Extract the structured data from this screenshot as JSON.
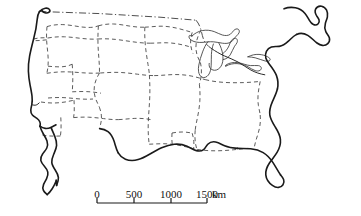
{
  "figure": {
    "kind": "outline-map",
    "region_label": "Contiguous United States",
    "background_color": "#ffffff",
    "coastline_color": "#1a1a1a",
    "state_border_color": "#4a4a4a",
    "national_border_color": "#3a3a3a",
    "lake_color": "#3a3a3a"
  },
  "scale_bar": {
    "unit": "km",
    "ticks": [
      "0",
      "500",
      "1000",
      "1500"
    ],
    "tick_values": [
      0,
      500,
      1000,
      1500
    ],
    "tick_x": [
      97,
      134,
      171,
      207
    ],
    "bar_y": 203,
    "tick_height": 5,
    "label_y": 198,
    "unit_x": 212,
    "unit_y": 198,
    "labels": {
      "t0": "0",
      "t1": "500",
      "t2": "1000",
      "t3": "1500",
      "unit": "km"
    }
  },
  "map_geometry": {
    "west_coast": "M 39.5 11.5 C 38.2 13.6 37.4 16.4 37.2 19.4 C 36.6 26.5 35.2 33.0 33.6 39.0 C 32.0 45.2 30.6 50.8 29.6 56.2 C 28.6 61.6 28.2 66.4 28.4 71.2 C 28.6 76.0 29.2 80.4 30.0 84.6 C 30.8 88.8 31.6 92.6 32.0 96.0 C 32.4 99.4 32.3 102.2 31.8 104.6 C 31.4 106.6 30.9 108.4 30.8 110.2 C 30.7 112.2 31.3 113.8 32.4 115.0 C 33.6 116.3 35.2 117.2 36.6 118.2 C 38.0 119.2 39.2 120.4 39.8 121.8 C 40.4 123.2 40.4 124.8 40.0 126.2",
    "west_coast_top_hook": "M 39.5 11.5 C 41.0 9.8 43.0 8.6 45.2 8.2 C 47.0 7.9 48.6 8.3 49.4 9.4 C 50.1 10.3 49.9 11.5 49.0 12.2 C 48.0 13.0 46.4 13.2 45.0 12.8 C 43.6 12.4 42.6 11.5 42.2 10.6",
    "california_bay": "M 31.8 104.6 C 33.2 105.2 34.8 105.4 36.2 105.0 C 37.4 104.6 38.4 103.8 39.2 102.9",
    "socal_coast": "M 40.0 126.2 C 41.6 127.4 43.4 128.2 45.2 128.4 C 47.2 128.6 49.2 128.2 51.0 127.4 C 52.8 126.6 54.4 125.6 56.0 124.8",
    "baja_peninsula": "M 40.0 126.2 C 40.8 129.0 42.0 131.6 43.4 134.0 C 44.8 136.4 46.2 138.6 47.0 141.0 C 47.8 143.4 47.8 145.8 46.8 148.0 C 45.8 150.2 44.0 152.0 42.6 154.0 C 41.2 156.0 40.4 158.2 40.8 160.4 C 41.2 162.6 42.8 164.4 44.4 166.2 C 46.0 168.0 47.4 170.0 47.8 172.2 C 48.2 174.4 47.6 176.6 46.6 178.6 C 45.6 180.6 44.4 182.4 43.6 184.4 C 42.8 186.4 42.6 188.6 43.4 190.4 C 44.2 192.2 45.8 193.4 47.2 194.6",
    "baja_peninsula_inner": "M 51.0 127.4 C 52.2 130.4 53.6 133.4 54.8 136.4 C 56.0 139.4 56.8 142.4 56.6 145.4 C 56.4 148.4 55.0 151.2 53.8 154.0 C 52.6 156.8 51.6 159.6 51.8 162.4 C 52.0 165.2 53.6 167.6 55.2 170.0 C 56.8 172.4 58.2 174.9 58.4 177.6 C 58.6 180.3 57.6 182.9 56.6 185.4",
    "gulf_california": "M 47.2 194.6 C 49.2 193.0 50.8 191.0 52.2 188.8 C 53.6 186.6 54.8 184.2 55.8 181.8 C 56.2 180.0 56.4 178.0 56.6 185.4",
    "canada_border_west": "M 39.5 11.5 L 100.0 13.6 L 160.0 17.2 L 196.0 20.2",
    "canada_border_lakes": "M 196.0 20.2 C 198.5 23.0 200.0 26.5 201.0 30.0 C 202.0 33.6 202.5 37.2 204.0 40.4 C 205.6 43.8 208.4 46.6 211.6 48.6",
    "lake_superior": "M 192.0 36.0 C 194.8 33.2 198.4 31.4 202.2 30.6 C 206.2 29.8 210.4 30.2 214.2 31.6 C 217.0 32.6 219.6 34.2 222.4 35.0 C 225.2 35.8 228.2 35.8 230.4 34.2 C 231.8 33.2 232.6 31.6 233.8 30.4 C 235.0 29.2 236.8 28.4 238.2 29.2 C 239.4 29.9 239.6 31.6 239.0 32.9 C 238.4 34.2 237.2 35.1 236.2 36.2 C 234.4 38.1 233.2 40.6 231.0 42.0 C 228.6 43.6 225.4 43.6 222.4 43.2 C 219.4 42.8 216.4 42.0 213.4 41.8 C 209.6 41.5 205.8 42.2 202.0 42.4 C 198.4 42.6 194.6 42.2 191.6 40.4 C 189.6 39.2 188.4 37.2 189.2 35.8 C 189.8 34.8 191.0 36.2 192.0 36.0 Z",
    "lake_michigan": "M 213.4 44.0 C 212.2 47.2 211.6 50.8 211.4 54.4 C 211.2 58.0 211.4 61.6 211.2 65.2 C 211.0 68.8 210.4 72.4 208.4 75.0 C 206.8 77.1 204.2 78.2 202.0 77.2 C 200.0 76.3 199.0 74.0 198.6 71.8 C 198.2 69.6 198.4 67.3 198.8 65.1 C 199.6 60.6 201.0 56.2 202.6 51.9 C 204.0 48.2 205.6 44.6 208.0 41.6",
    "lake_huron": "M 219.0 43.4 C 220.8 46.6 222.0 50.2 222.6 53.8 C 223.2 57.4 223.2 61.0 222.0 64.2 C 221.0 66.9 219.0 69.2 216.4 70.0 C 214.2 70.7 211.6 70.0 210.2 68.2 C 209.2 66.9 208.9 65.1 209.2 63.4 M 222.6 53.8 C 225.4 51.8 227.6 49.0 229.0 45.8 C 230.0 43.5 230.6 41.0 232.4 39.4 C 233.6 38.3 235.4 37.8 236.6 38.8 C 237.6 39.7 237.6 41.4 237.0 42.7 C 236.4 44.0 235.4 45.0 234.6 46.2 C 232.8 48.9 232.0 52.2 230.2 54.9 C 228.6 57.3 226.0 59.2 223.2 59.6",
    "lake_erie": "M 226.0 66.0 C 229.4 64.2 233.2 63.4 237.0 63.6 C 240.8 63.8 244.6 65.0 248.0 66.8 C 250.4 68.1 252.6 69.8 255.2 70.6 C 256.8 71.1 258.6 71.2 260.0 70.4 C 261.0 69.8 261.6 68.6 261.2 67.5 C 260.8 66.4 259.6 65.8 258.4 65.6 C 255.8 65.2 253.2 65.8 250.6 65.6 C 246.2 65.3 242.2 63.2 237.8 62.6 C 233.8 62.1 229.6 62.8 226.2 64.8 C 225.2 65.4 224.8 66.6 226.0 66.0 Z",
    "lake_ontario": "M 248.0 56.8 C 251.4 55.0 255.2 54.2 259.0 54.4 C 262.0 54.6 265.0 55.4 267.6 56.8 C 269.2 57.7 270.8 58.9 270.0 60.2 C 269.2 61.5 267.0 61.4 265.2 61.0 C 261.8 60.2 258.6 58.6 255.2 57.8 C 252.8 57.2 250.2 57.0 248.0 56.8 Z",
    "east_coast_north": "M 211.6 48.6 C 215.6 51.4 219.8 53.8 224.2 55.8 C 228.8 57.9 233.6 59.6 238.0 62.0 C 242.4 64.4 246.4 67.6 250.8 70.0 C 255.2 72.4 260.0 74.0 264.8 74.8",
    "maine_outline": "M 284.0 8.8 C 287.6 7.4 291.6 7.0 295.4 7.8 C 299.2 8.6 302.6 10.6 305.0 13.4 C 306.8 15.5 308.0 18.0 309.4 20.4 C 310.4 22.1 311.6 23.8 313.4 24.6 C 315.0 25.3 317.0 25.0 318.2 23.8 C 319.2 22.8 319.4 21.2 319.0 19.8 C 318.6 18.4 317.6 17.3 316.8 16.1 C 315.4 14.0 314.6 11.4 315.6 9.2 C 316.6 7.0 319.2 5.8 321.6 6.2 C 323.8 6.6 325.6 8.2 326.6 10.2 C 327.6 12.2 327.8 14.6 327.4 16.8 C 327.0 19.0 326.0 21.0 325.4 23.2 C 324.6 26.0 324.6 29.0 325.8 31.6 C 326.8 33.8 328.8 35.6 329.4 38.0 C 329.9 40.0 329.2 42.2 327.8 43.6 C 326.4 45.0 324.4 45.6 322.4 45.4 C 320.4 45.2 318.6 44.2 317.0 43.0 C 313.8 40.6 311.2 37.4 307.8 35.4 C 304.4 33.4 300.2 32.8 296.6 34.4",
    "northeast_coast": "M 296.6 34.4 C 293.4 36.0 291.0 38.8 288.4 41.2 C 285.8 43.6 282.8 45.8 279.2 46.4 C 276.6 46.8 273.8 46.2 271.4 47.0 C 269.2 47.7 267.4 49.4 266.4 51.4 C 265.4 53.4 265.2 55.8 265.8 58.0 C 266.4 60.2 267.8 62.1 269.2 63.9 C 272.0 67.5 274.8 71.1 276.4 75.4 C 278.0 79.7 278.4 84.6 277.4 89.0",
    "atlantic_coast": "M 277.4 89.0 C 276.4 93.4 274.2 97.4 272.4 101.6 C 270.6 105.8 269.2 110.4 269.8 114.9 C 270.4 119.4 273.0 123.4 275.4 127.2 C 277.8 131.0 280.0 135.0 280.4 139.4 C 280.8 143.8 279.4 148.4 277.2 152.2 C 275.0 156.0 272.0 159.2 269.6 162.8 C 267.2 166.4 265.4 170.6 265.8 174.9 C 266.2 179.2 269.0 183.0 272.4 185.4 C 274.2 186.7 276.4 187.6 278.6 187.4 C 280.4 187.2 282.0 186.2 283.0 184.7 C 284.0 183.2 284.2 181.2 283.6 179.5 C 283.0 177.8 281.8 176.4 280.6 175.0",
    "florida_west": "M 280.6 175.0 C 277.8 171.0 275.6 166.6 273.0 162.6 C 270.4 158.6 267.2 155.0 263.2 152.6 C 259.4 150.3 255.0 149.2 250.6 148.8 C 246.2 148.4 241.8 148.6 237.4 148.4",
    "gulf_coast": "M 237.4 148.4 C 233.0 148.2 228.6 147.6 224.6 145.8 C 221.6 144.5 218.8 142.6 215.6 142.0 C 212.8 141.5 209.8 142.2 207.8 144.2 C 206.2 145.8 205.4 148.2 203.6 149.6 C 201.6 151.1 198.8 151.2 196.4 150.6 C 193.0 149.7 190.2 147.6 187.0 146.2 C 183.0 144.4 178.6 143.8 174.2 144.2 C 169.8 144.6 165.6 146.0 161.6 147.8 C 157.6 149.6 153.8 151.8 150.0 154.0 C 146.2 156.2 142.4 158.4 138.2 159.6 C 134.0 160.8 129.4 160.9 125.4 159.2 C 122.4 157.9 119.8 155.6 118.2 152.8",
    "texas_coast": "M 118.2 152.8 C 116.2 149.4 115.4 145.4 114.2 141.6 C 113.0 137.8 111.2 134.0 108.0 131.6 C 105.6 129.8 102.6 128.9 99.6 128.6",
    "state_borders": [
      "M 47.0 26.6 C 52.0 25.0 57.4 24.4 62.8 24.6 C 68.2 24.8 73.6 25.8 78.8 26.6 C 82.8 27.2 86.8 27.6 90.8 27.4 C 93.4 27.3 96.0 26.8 98.4 25.8",
      "M 98.4 25.8 C 103.4 24.4 108.6 23.8 113.8 24.0 C 119.0 24.2 124.2 25.2 129.2 26.0 C 134.4 26.8 139.6 27.4 144.8 27.2",
      "M 144.8 27.2 C 150.2 27.0 155.6 26.2 161.0 26.2 C 166.4 26.2 171.8 27.0 177.0 28.2 C 182.2 29.4 187.2 31.0 192.2 32.4",
      "M 192.2 32.4 C 191.0 36.0 190.4 39.8 190.6 43.6 C 190.8 47.0 191.6 50.4 193.0 53.5",
      "M 33.6 39.0 C 37.4 38.0 41.4 37.6 45.4 37.8 C 46.2 37.84 47.0 37.9 47.8 38.0",
      "M 47.0 26.6 C 46.6 31.0 46.4 35.4 46.6 39.8 C 46.8 44.2 47.4 48.6 47.8 53.0 C 48.2 57.4 48.4 61.8 48.0 66.2 C 47.8 68.6 47.4 71.0 46.8 73.3",
      "M 98.4 25.8 C 98.0 32.0 97.8 38.2 98.0 44.4 C 98.2 50.6 98.8 56.8 99.2 63.0 C 99.4 66.4 99.6 69.8 99.4 73.2",
      "M 144.8 27.2 C 144.6 33.4 144.8 39.6 145.4 45.8 C 146.0 52.0 147.0 58.2 148.0 64.4 C 148.6 68.0 149.2 71.6 149.4 75.2",
      "M 47.8 38.0 C 53.4 37.0 59.0 36.6 64.6 36.8 C 70.2 37.0 75.8 37.8 81.4 38.4 C 87.0 39.0 92.6 39.4 98.0 39.0",
      "M 98.0 39.0 C 103.8 38.6 109.6 38.8 115.4 39.4 C 121.2 40.0 127.0 41.0 132.8 41.8 C 138.6 42.6 144.4 43.2 150.2 43.2",
      "M 150.2 43.2 C 156.0 43.2 161.8 42.6 167.6 42.8 C 173.4 43.0 179.2 44.0 184.8 45.4 C 187.2 46.0 189.6 46.7 192.0 47.5",
      "M 46.8 73.3 C 52.8 72.4 58.8 71.8 64.8 71.8 C 70.8 71.8 76.8 72.4 82.8 72.8 C 88.6 73.2 94.4 73.4 100.2 73.0",
      "M 100.2 73.0 C 106.4 72.6 112.6 72.2 118.8 72.4 C 125.0 72.6 131.2 73.4 137.4 74.2 C 143.0 74.9 148.6 75.6 154.2 75.6",
      "M 154.2 75.6 C 160.4 75.6 166.6 74.8 172.8 74.6 C 179.0 74.4 185.2 74.8 191.2 76.0 C 196.0 76.9 200.6 78.4 205.2 79.6",
      "M 205.2 79.6 C 211.4 81.2 217.8 82.0 224.2 82.4 C 230.6 82.8 237.0 82.8 243.4 82.6 C 249.0 82.4 254.6 82.0 260.2 81.4",
      "M 48.0 66.2 C 52.6 66.6 57.2 67.0 61.8 66.8 C 65.4 66.6 69.0 65.8 72.2 64.2",
      "M 72.2 64.2 C 72.6 68.8 72.8 73.4 72.8 78.0 C 72.8 82.6 72.6 87.2 72.2 91.8",
      "M 99.4 73.2 C 97.2 76.8 95.4 80.8 94.6 84.9 C 93.8 89.0 94.0 93.4 95.2 97.4 C 96.2 100.8 98.0 104.0 99.4 107.2",
      "M 99.4 107.2 C 100.4 110.0 101.2 112.9 101.4 115.9 C 101.6 119.0 101.2 122.2 100.4 125.2 C 100.1 126.4 99.8 127.5 99.6 128.6",
      "M 149.4 75.2 C 149.8 82.0 150.0 88.8 149.8 95.6 C 149.6 102.4 149.0 109.2 148.6 116.0 C 148.3 121.0 148.1 126.0 148.2 131.0 C 148.3 135.4 148.6 139.8 149.2 144.2",
      "M 72.2 91.8 C 77.0 91.6 81.8 91.4 86.6 91.6 C 91.4 91.8 96.2 92.4 101.0 93.2",
      "M 48.0 98.0 C 53.0 97.6 58.0 97.4 63.0 97.6 C 68.0 97.8 73.0 98.4 78.0 98.8 C 83.0 99.2 88.0 99.4 93.0 99.0",
      "M 41.0 102.0 C 45.0 102.6 49.0 103.0 53.0 103.0 C 57.0 103.0 61.0 102.6 65.0 102.0 C 68.0 101.5 71.0 100.8 74.0 100.2",
      "M 74.0 100.2 C 74.2 104.0 74.4 107.8 74.2 111.6 C 74.1 113.6 73.9 115.6 73.6 117.6",
      "M 73.6 117.6 C 78.6 117.2 83.6 117.0 88.6 117.2 C 93.6 117.4 98.6 118.0 103.6 118.6 C 108.6 119.2 113.6 119.8 118.6 119.6",
      "M 118.6 119.6 C 124.0 119.4 129.4 118.6 134.8 118.4 C 140.2 118.2 145.6 118.6 150.8 119.6",
      "M 201.0 30.0 C 199.0 33.8 197.2 37.8 196.4 42.0 C 195.6 46.2 195.8 50.6 197.0 54.7 C 197.8 57.4 199.0 60.0 200.4 62.4",
      "M 200.4 62.4 C 201.2 66.0 201.6 69.7 201.4 73.4 C 201.2 77.1 200.4 80.7 199.4 84.2",
      "M 199.4 84.2 C 200.0 90.0 200.2 95.8 199.8 101.6 C 199.4 107.4 198.4 113.1 197.2 118.8 C 196.4 122.6 195.6 126.4 195.2 130.2",
      "M 195.2 130.2 C 194.8 134.4 194.8 138.6 195.4 142.8 C 195.8 145.4 196.4 148.0 197.2 150.6",
      "M 260.2 81.4 C 259.4 85.4 258.6 89.4 258.2 93.4 C 257.8 97.4 257.8 101.4 258.4 105.4 C 258.9 108.6 259.8 111.8 260.2 115.0",
      "M 260.2 115.0 C 260.6 119.2 260.4 123.4 259.6 127.5 C 258.8 131.6 257.4 135.6 256.2 139.6 C 255.4 142.4 254.6 145.2 254.2 148.0",
      "M 149.2 144.2 C 154.8 144.0 160.4 143.6 166.0 143.8 C 171.6 144.0 177.2 144.8 182.6 146.0 C 187.4 147.1 192.2 148.6 197.2 149.4",
      "M 197.2 149.4 C 203.2 150.4 209.2 150.8 215.2 150.8 C 221.2 150.8 227.2 150.4 233.2 149.8 C 238.2 149.3 243.2 148.7 248.2 148.4",
      "M 172.0 133.0 C 171.8 136.8 171.8 140.6 172.2 144.4",
      "M 172.0 133.0 C 175.4 132.4 178.8 132.0 182.2 132.0 C 185.6 132.0 189.0 132.4 192.2 133.2",
      "M 192.2 133.2 C 193.0 136.0 193.6 138.8 193.8 141.7 C 194.0 144.0 193.9 146.4 193.6 148.7",
      "M 46.6 39.8 C 42.0 40.4 37.4 40.8 32.8 40.6",
      "M 60.8 117.4 C 61.0 121.6 61.2 125.8 61.0 130.0 C 60.9 132.0 60.7 134.0 60.4 136.0",
      "M 60.4 136.0 C 56.0 136.2 51.6 136.2 47.2 135.8 C 44.6 135.5 42.0 135.0 39.6 134.2"
    ]
  }
}
